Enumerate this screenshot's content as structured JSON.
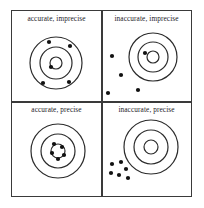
{
  "figure": {
    "background_color": "#ffffff",
    "line_color": "#2b2b2b",
    "dot_color": "#111111",
    "frame_color": "#3a3a3a"
  },
  "quadrants": [
    {
      "id": "accurate-imprecise",
      "label": "accurate, imprecise",
      "target": {
        "cx": 44,
        "cy": 52,
        "radii": [
          26,
          16,
          6
        ]
      },
      "dots": [
        {
          "x": 37,
          "y": 31
        },
        {
          "x": 58,
          "y": 35
        },
        {
          "x": 39,
          "y": 56
        },
        {
          "x": 31,
          "y": 72
        },
        {
          "x": 57,
          "y": 71
        }
      ],
      "dot_radius": 2.1
    },
    {
      "id": "inaccurate-imprecise",
      "label": "inaccurate, imprecise",
      "target": {
        "cx": 51,
        "cy": 46,
        "radii": [
          24,
          15,
          6
        ]
      },
      "dots": [
        {
          "x": 43,
          "y": 42
        },
        {
          "x": 10,
          "y": 45
        },
        {
          "x": 19,
          "y": 64
        },
        {
          "x": 36,
          "y": 79
        },
        {
          "x": 6,
          "y": 82
        }
      ],
      "dot_radius": 2.1
    },
    {
      "id": "accurate-precise",
      "label": "accurate, precise",
      "target": {
        "cx": 46,
        "cy": 49,
        "radii": [
          27,
          17,
          7
        ]
      },
      "dots": [
        {
          "x": 42,
          "y": 42
        },
        {
          "x": 50,
          "y": 45
        },
        {
          "x": 40,
          "y": 51
        },
        {
          "x": 52,
          "y": 53
        },
        {
          "x": 46,
          "y": 57
        }
      ],
      "dot_radius": 2.1
    },
    {
      "id": "inaccurate-precise",
      "label": "inaccurate, precise",
      "target": {
        "cx": 49,
        "cy": 45,
        "radii": [
          27,
          17,
          7
        ]
      },
      "dots": [
        {
          "x": 10,
          "y": 62
        },
        {
          "x": 19,
          "y": 60
        },
        {
          "x": 24,
          "y": 67
        },
        {
          "x": 9,
          "y": 71
        },
        {
          "x": 17,
          "y": 73
        },
        {
          "x": 26,
          "y": 76
        }
      ],
      "dot_radius": 2.1
    }
  ]
}
